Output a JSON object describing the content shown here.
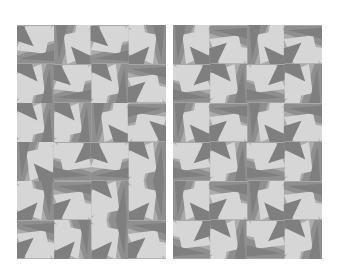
{
  "figure": {
    "panels": [
      {
        "id": "left",
        "label": "",
        "grid": {
          "cols": 4,
          "rows": 6
        },
        "description": "randomly rotated geometric tiles"
      },
      {
        "id": "right",
        "label": "",
        "grid": {
          "cols": 4,
          "rows": 6
        },
        "description": "tiles arranged in repeating 2x2 pinwheel motifs"
      }
    ],
    "colors": {
      "background": "#ffffff",
      "light": "#d6d6d6",
      "mid": "#ababab",
      "dark": "#7f7f7f",
      "darker": "#8f8f8f"
    }
  }
}
